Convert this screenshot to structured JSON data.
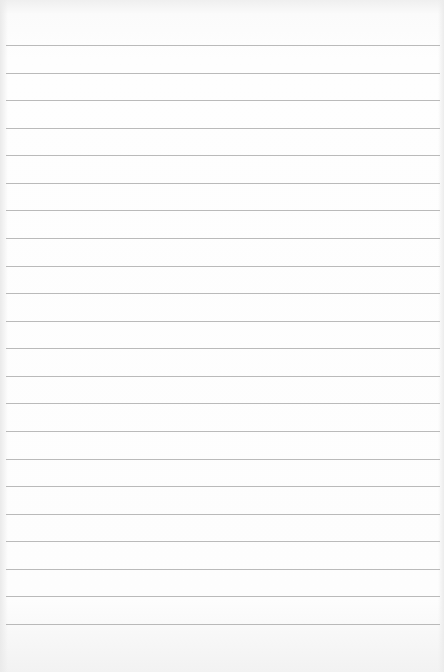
{
  "paper": {
    "type": "ruled-notebook-paper",
    "line_count": 22,
    "first_line_y": 45,
    "line_spacing": 27.57,
    "line_color": "#a9a9a9",
    "background_color": "#fdfdfd"
  }
}
